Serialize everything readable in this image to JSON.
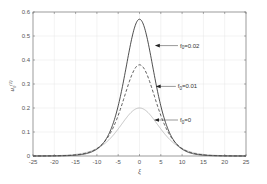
{
  "chart_data": {
    "type": "line",
    "title": "",
    "xlabel": "ξ",
    "ylabel": "u0(1)",
    "xlim": [
      -25,
      25
    ],
    "ylim": [
      0,
      0.6
    ],
    "grid": true,
    "xticks": [
      -25,
      -20,
      -15,
      -10,
      -5,
      0,
      5,
      10,
      15,
      20,
      25
    ],
    "yticks": [
      0,
      0.1,
      0.2,
      0.3,
      0.4,
      0.5,
      0.6
    ],
    "xtick_labels": [
      "-25",
      "-20",
      "-15",
      "-10",
      "-5",
      "0",
      "5",
      "10",
      "15",
      "20",
      "25"
    ],
    "ytick_labels": [
      "0",
      "0.1",
      "0.2",
      "0.3",
      "0.4",
      "0.5",
      "0.6"
    ],
    "series": [
      {
        "name": "f0=0.02",
        "style": "solid",
        "color": "#222222",
        "peak": 0.57,
        "width": 4.6
      },
      {
        "name": "f0=0.01",
        "style": "dashed",
        "color": "#333333",
        "peak": 0.38,
        "width": 5.2
      },
      {
        "name": "f0=0",
        "style": "solid",
        "color": "#bbbbbb",
        "peak": 0.2,
        "width": 6.3
      }
    ],
    "annotations": [
      {
        "text": "f0=0.02",
        "sub": "0",
        "base": "f",
        "rest": "=0.02",
        "arrow_to_x": 3.6,
        "arrow_to_y": 0.46,
        "text_x": 9.5
      },
      {
        "text": "f0=0.01",
        "sub": "0",
        "base": "f",
        "rest": "=0.01",
        "arrow_to_x": 3.8,
        "arrow_to_y": 0.29,
        "text_x": 9.0
      },
      {
        "text": "f0=0",
        "sub": "0",
        "base": "f",
        "rest": "=0",
        "arrow_to_x": 3.4,
        "arrow_to_y": 0.15,
        "text_x": 9.5
      }
    ]
  }
}
